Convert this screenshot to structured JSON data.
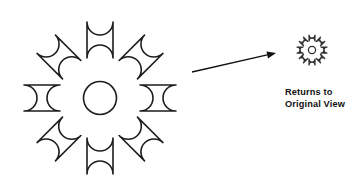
{
  "canvas": {
    "width": 349,
    "height": 195,
    "background": "#ffffff"
  },
  "diagram": {
    "title": "Returns to Original View",
    "stroke_color": "#1d1d1d",
    "small_stroke_color": "#303030",
    "fill_color": "#ffffff"
  },
  "large_flower": {
    "name": "eight-petal rosette",
    "center_x": 100,
    "center_y": 98,
    "petal_count": 8,
    "petal_angles": [
      0,
      45,
      90,
      135,
      180,
      225,
      270,
      315
    ],
    "petal_inner_radius": 27,
    "petal_outer_radius": 89,
    "petal_half_width": 13,
    "hub_radius": 16.5
  },
  "small_flower": {
    "name": "eight-petal rosette thumbnail",
    "center_x": 312,
    "center_y": 50,
    "petal_count": 8,
    "petal_angles": [
      0,
      45,
      90,
      135,
      180,
      225,
      270,
      315
    ],
    "petal_inner_radius": 6.0,
    "petal_outer_radius": 18.0,
    "petal_half_width": 3.0,
    "hub_radius": 3.6
  },
  "arrow": {
    "label": "transition arrow",
    "start_x": 192,
    "start_y": 72,
    "end_x": 276,
    "end_y": 53,
    "head_length": 9,
    "head_half_width": 3.6,
    "color": "#111111"
  },
  "caption": {
    "line1": "Returns to",
    "line2": "Original View",
    "x": 285,
    "line1_y": 95,
    "line2_y": 107,
    "color": "#111111"
  }
}
